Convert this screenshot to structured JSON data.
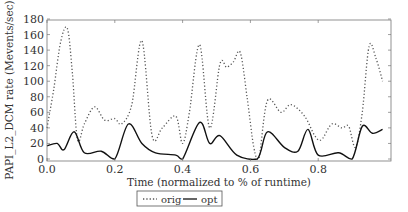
{
  "chart_data": {
    "type": "line",
    "title": "",
    "xlabel": "Time (normalized to % of runtime)",
    "ylabel": "PAPI_L2_DCM rate (Mevents/sec)",
    "xlim": [
      0.0,
      1.0
    ],
    "ylim": [
      0,
      180
    ],
    "xticks": [
      "0.0",
      "0.2",
      "0.4",
      "0.6",
      "0.8"
    ],
    "yticks": [
      "0",
      "20",
      "40",
      "60",
      "80",
      "100",
      "120",
      "140",
      "160",
      "180"
    ],
    "grid": false,
    "legend_position": "bottom-center",
    "series": [
      {
        "name": "orig",
        "style": "dotted",
        "color": "#555555",
        "x": [
          0.0,
          0.02,
          0.04,
          0.06,
          0.075,
          0.09,
          0.11,
          0.14,
          0.17,
          0.2,
          0.22,
          0.25,
          0.28,
          0.31,
          0.34,
          0.38,
          0.4,
          0.42,
          0.45,
          0.48,
          0.51,
          0.53,
          0.55,
          0.57,
          0.59,
          0.61,
          0.625,
          0.65,
          0.69,
          0.72,
          0.76,
          0.79,
          0.81,
          0.84,
          0.87,
          0.89,
          0.91,
          0.93,
          0.95,
          0.97,
          0.99
        ],
        "y": [
          40,
          90,
          150,
          168,
          110,
          25,
          45,
          67,
          50,
          52,
          45,
          70,
          152,
          30,
          40,
          55,
          20,
          60,
          147,
          40,
          122,
          118,
          125,
          137,
          80,
          15,
          0,
          75,
          60,
          70,
          55,
          30,
          25,
          45,
          40,
          42,
          15,
          60,
          145,
          130,
          100
        ]
      },
      {
        "name": "opt",
        "style": "solid",
        "color": "#111111",
        "x": [
          0.0,
          0.03,
          0.05,
          0.08,
          0.11,
          0.16,
          0.2,
          0.24,
          0.28,
          0.32,
          0.38,
          0.4,
          0.45,
          0.48,
          0.51,
          0.56,
          0.62,
          0.65,
          0.7,
          0.74,
          0.77,
          0.8,
          0.86,
          0.9,
          0.93,
          0.96,
          0.99
        ],
        "y": [
          17,
          20,
          12,
          35,
          8,
          10,
          0,
          45,
          20,
          8,
          5,
          0,
          47,
          20,
          30,
          5,
          0,
          35,
          15,
          10,
          38,
          5,
          8,
          0,
          42,
          33,
          38
        ]
      }
    ]
  },
  "legend": {
    "items": [
      {
        "label": "orig",
        "symbol": "dotted-line"
      },
      {
        "label": "opt",
        "symbol": "solid-line"
      }
    ]
  }
}
